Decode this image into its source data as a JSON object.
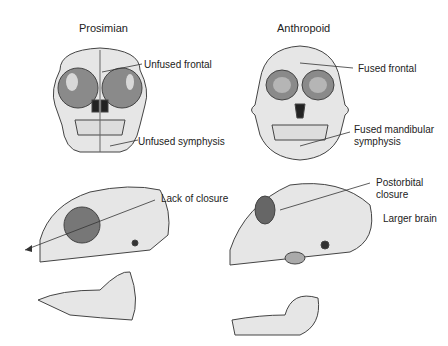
{
  "titles": {
    "left": "Prosimian",
    "right": "Anthropoid"
  },
  "labels": {
    "unfused_frontal": "Unfused frontal",
    "unfused_symphysis": "Unfused symphysis",
    "fused_frontal": "Fused frontal",
    "fused_mandibular_1": "Fused mandibular",
    "fused_mandibular_2": "symphysis",
    "lack_of_closure": "Lack of closure",
    "postorbital_1": "Postorbital",
    "postorbital_2": "closure",
    "larger_brain": "Larger brain"
  },
  "colors": {
    "bone": "#e6e6e6",
    "bone_shadow": "#bdbdbd",
    "outline": "#444444",
    "orbit": "#8a8a8a",
    "text": "#222222"
  }
}
